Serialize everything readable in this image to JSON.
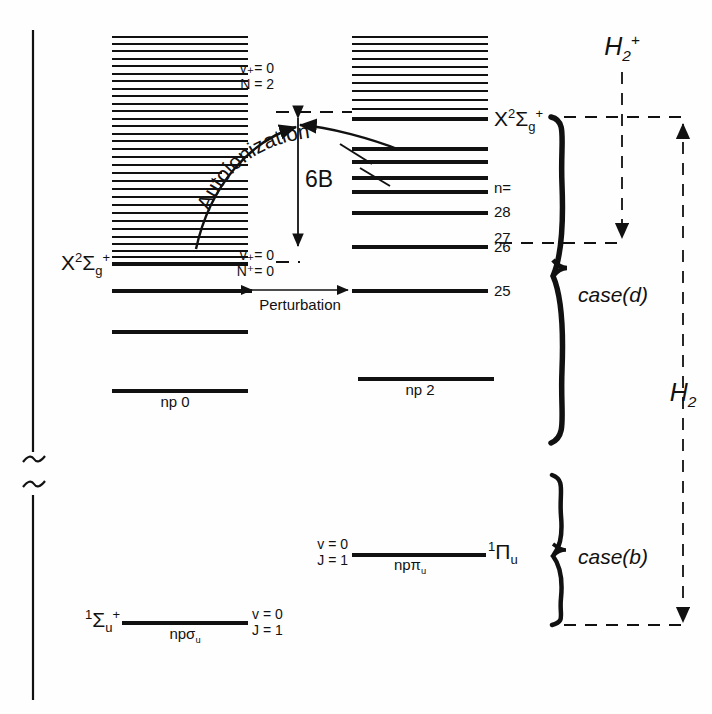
{
  "figure": {
    "type": "energy-level-diagram",
    "background": "#ffffff",
    "ink": "#111111"
  },
  "axis": {
    "name": "energy-axis",
    "broken": true,
    "break_label": "axis-break-squiggle"
  },
  "left_column": {
    "series_label": "X2Sigma-g-plus",
    "state_label_parts": {
      "prefix": "X",
      "superscript": "2",
      "greek": "Σ",
      "sub": "g",
      "sup": "+"
    },
    "ladder": {
      "name": "left-rydberg-ladder",
      "count": 31,
      "x_left": 112,
      "x_right": 248,
      "y_top": 36,
      "y_bottom": 255,
      "spacing": 7.3
    },
    "levels": [
      {
        "label": "X2Sigma-g-plus-limit",
        "y": 262,
        "weight": "bold"
      },
      {
        "label": "level-n-lower",
        "y": 290,
        "weight": "bold"
      },
      {
        "label": "level-np-mid",
        "y": 330,
        "weight": "bold"
      },
      {
        "label": "np0",
        "y": 389,
        "weight": "bold"
      }
    ],
    "np0_label": "np 0",
    "npsigma_label": "npσ",
    "npsigma_sub": "u",
    "ground_state": {
      "term_prefix": "1",
      "term": "Σ",
      "term_sub": "u",
      "term_sup": "+",
      "v": "v = 0",
      "J": "J = 1"
    }
  },
  "right_column": {
    "state_label_parts": {
      "prefix": "X",
      "superscript": "2",
      "greek": "Σ",
      "sub": "g",
      "sup": "+"
    },
    "ladder": {
      "name": "right-rydberg-ladder",
      "count": 12,
      "x_left": 352,
      "x_right": 488,
      "y_top": 36,
      "y_bottom": 118,
      "spacing": 7.3
    },
    "n_marker": "n=",
    "n_values": [
      "28",
      "27",
      "26",
      "25"
    ],
    "levels": [
      {
        "label": "X2Sigma-g-plus-limit",
        "y": 118,
        "weight": "bold"
      },
      {
        "label": "n-upper-a",
        "y": 148,
        "weight": "bold"
      },
      {
        "label": "n-upper-b",
        "y": 161,
        "weight": "bold"
      },
      {
        "label": "n-29",
        "y": 176,
        "weight": "bold"
      },
      {
        "label": "n-28",
        "y": 188,
        "weight": "bold"
      },
      {
        "label": "n-27",
        "y": 208,
        "weight": "bold"
      },
      {
        "label": "n-26",
        "y": 243,
        "weight": "bold"
      },
      {
        "label": "n-25",
        "y": 288,
        "weight": "bold"
      },
      {
        "label": "np2",
        "y": 377,
        "weight": "bold"
      }
    ],
    "np2_label": "np 2",
    "nppi_label": "npπ",
    "nppi_sub": "u",
    "pi_state": {
      "term_prefix": "1",
      "term": "Π",
      "term_sub": "u",
      "v": "v = 0",
      "J": "J = 1"
    }
  },
  "annotations": {
    "autoionization": "Autoionization",
    "perturbation": "Perturbation",
    "six_b": "6B",
    "v_plus_top": "v₊= 0",
    "N_top": "N = 2",
    "v_plus_bottom": "v₊= 0",
    "N_bottom": "N⁺= 0"
  },
  "brackets": {
    "case_d": {
      "label": "case(d)",
      "y_top": 117,
      "y_bottom": 443
    },
    "case_b": {
      "label": "case(b)",
      "y_top": 475,
      "y_bottom": 625
    }
  },
  "scales": {
    "h2_plus": {
      "label_prefix": "H",
      "sub": "2",
      "sup": "+",
      "y_top": 118,
      "y_bottom": 243
    },
    "h2": {
      "label_prefix": "H",
      "sub": "2",
      "y_top": 118,
      "y_bottom": 625
    }
  }
}
